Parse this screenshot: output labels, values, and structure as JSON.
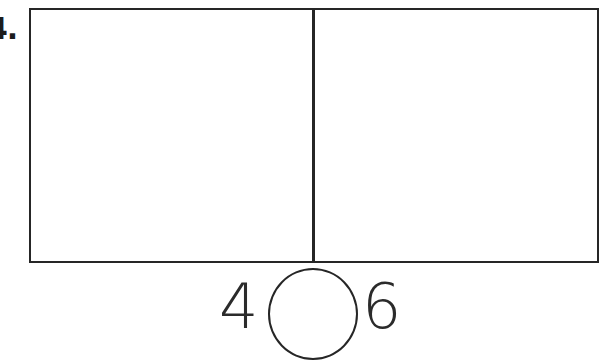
{
  "page": {
    "background_color": "#ffffff",
    "ink_color": "#262626"
  },
  "problem": {
    "item_number": "4.",
    "bar_model": {
      "part_count": 2,
      "divider_position_ratio": 0.49,
      "stroke_color": "#262626"
    },
    "comparison": {
      "left_operand": "4",
      "operator": "",
      "operator_placeholder_shape": "circle",
      "right_operand": "6"
    }
  }
}
